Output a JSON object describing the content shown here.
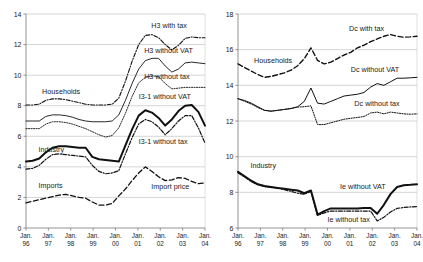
{
  "figure": {
    "panels": [
      "left-panel-households-industry",
      "right-panel-households-industry"
    ]
  },
  "chart_data": [
    {
      "type": "line",
      "id": "left",
      "title": "",
      "xlabel": "",
      "ylabel": "",
      "grid": true,
      "legend_position": "inline-annotations",
      "ylim": [
        0,
        14
      ],
      "yticks": [
        0,
        2,
        4,
        6,
        8,
        10,
        12,
        14
      ],
      "ytick_labels": [
        "0",
        "2",
        "4",
        "6",
        "8",
        "10",
        "12",
        "14"
      ],
      "x": [
        "Jan. 96",
        "Jan. 97",
        "Jan. 98",
        "Jan. 99",
        "Jan. 00",
        "Jan. 01",
        "Jan. 02",
        "Jan. 03",
        "Jan. 04"
      ],
      "xtick_labels_line1": [
        "Jan.",
        "Jan.",
        "Jan.",
        "Jan.",
        "Jan.",
        "Jan.",
        "Jan.",
        "Jan.",
        "Jan."
      ],
      "xtick_labels_line2": [
        "96",
        "97",
        "98",
        "99",
        "00",
        "01",
        "02",
        "03",
        "04"
      ],
      "group_labels": [
        {
          "text": "Households",
          "x_frac": 0.09,
          "y_value": 8.75
        },
        {
          "text": "Industry",
          "x_frac": 0.07,
          "y_value": 5.0
        },
        {
          "text": "Imports",
          "x_frac": 0.07,
          "y_value": 2.6
        }
      ],
      "annotations": [
        {
          "text": "H3 with tax",
          "x_frac": 0.7,
          "y_value": 13.1
        },
        {
          "text": "H3 without VAT",
          "x_frac": 0.66,
          "y_value": 11.45
        },
        {
          "text": "H3 without tax",
          "x_frac": 0.66,
          "y_value": 9.75
        },
        {
          "text": "I3-1 without VAT",
          "x_frac": 0.63,
          "y_value": 8.45
        },
        {
          "text": "I3-1 without tax",
          "x_frac": 0.63,
          "y_value": 5.5
        },
        {
          "text": "Import price",
          "x_frac": 0.7,
          "y_value": 2.55
        }
      ],
      "series": [
        {
          "name": "H3 with tax",
          "style": "dash-dot",
          "width": 1.1,
          "values": [
            8.05,
            8.05,
            8.1,
            8.35,
            8.45,
            8.45,
            8.4,
            8.3,
            8.2,
            8.1,
            8.05,
            8.05,
            8.05,
            8.1,
            8.5,
            9.6,
            10.9,
            12.0,
            12.6,
            12.65,
            12.45,
            12.0,
            11.65,
            11.95,
            12.4,
            12.5,
            12.45,
            12.45
          ]
        },
        {
          "name": "H3 without VAT",
          "style": "solid",
          "width": 0.9,
          "values": [
            7.0,
            7.0,
            7.0,
            7.3,
            7.4,
            7.4,
            7.35,
            7.25,
            7.1,
            7.0,
            6.95,
            6.95,
            6.95,
            7.0,
            7.4,
            8.35,
            9.45,
            10.4,
            10.95,
            11.1,
            11.1,
            10.6,
            10.2,
            10.4,
            10.8,
            10.85,
            10.8,
            10.75
          ]
        },
        {
          "name": "H3 without tax",
          "style": "dotted",
          "width": 0.9,
          "values": [
            6.5,
            6.5,
            6.5,
            6.8,
            6.95,
            6.95,
            6.9,
            6.8,
            6.65,
            6.5,
            6.3,
            6.1,
            5.95,
            6.05,
            6.55,
            7.5,
            8.6,
            9.5,
            9.85,
            9.95,
            9.9,
            9.45,
            9.1,
            9.15,
            9.2,
            9.2,
            9.2,
            9.2
          ]
        },
        {
          "name": "I3-1 without VAT",
          "style": "solid-bold",
          "width": 2.0,
          "values": [
            4.35,
            4.4,
            4.55,
            4.95,
            5.25,
            5.35,
            5.35,
            5.3,
            5.25,
            5.25,
            4.65,
            4.5,
            4.45,
            4.4,
            4.35,
            5.4,
            6.45,
            7.35,
            7.7,
            7.55,
            7.2,
            6.7,
            7.1,
            7.65,
            8.0,
            8.05,
            7.6,
            6.7
          ]
        },
        {
          "name": "I3-1 without tax",
          "style": "dash-dot",
          "width": 1.2,
          "values": [
            3.85,
            3.9,
            4.1,
            4.5,
            4.8,
            4.85,
            4.8,
            4.75,
            4.7,
            4.65,
            4.1,
            3.7,
            3.55,
            3.6,
            3.75,
            4.85,
            5.9,
            6.8,
            7.1,
            6.95,
            6.6,
            6.1,
            6.5,
            7.0,
            7.35,
            7.35,
            6.55,
            5.55
          ]
        },
        {
          "name": "Import price",
          "style": "dashed",
          "width": 1.3,
          "values": [
            1.65,
            1.75,
            1.85,
            1.95,
            2.05,
            2.15,
            2.2,
            2.1,
            2.0,
            1.95,
            1.7,
            1.5,
            1.5,
            1.6,
            2.1,
            2.55,
            3.1,
            3.6,
            4.0,
            3.7,
            3.35,
            3.1,
            3.15,
            3.3,
            3.25,
            3.05,
            2.9,
            2.95
          ]
        }
      ]
    },
    {
      "type": "line",
      "id": "right",
      "title": "",
      "xlabel": "",
      "ylabel": "",
      "grid": true,
      "legend_position": "inline-annotations",
      "ylim": [
        6,
        18
      ],
      "yticks": [
        6,
        8,
        10,
        12,
        14,
        16,
        18
      ],
      "ytick_labels": [
        "6",
        "8",
        "10",
        "12",
        "14",
        "16",
        "18"
      ],
      "x": [
        "Jan. 96",
        "Jan. 97",
        "Jan. 98",
        "Jan. 99",
        "Jan. 00",
        "Jan. 01",
        "Jan. 02",
        "Jan. 03",
        "Jan. 04"
      ],
      "xtick_labels_line1": [
        "Jan.",
        "Jan.",
        "Jan.",
        "Jan.",
        "Jan.",
        "Jan.",
        "Jan.",
        "Jan.",
        "Jan."
      ],
      "xtick_labels_line2": [
        "96",
        "97",
        "98",
        "99",
        "00",
        "01",
        "02",
        "03",
        "04"
      ],
      "group_labels": [
        {
          "text": "Households",
          "x_frac": 0.09,
          "y_value": 15.25
        },
        {
          "text": "Industry",
          "x_frac": 0.07,
          "y_value": 9.35
        }
      ],
      "annotations": [
        {
          "text": "Dc with tax",
          "x_frac": 0.62,
          "y_value": 17.05
        },
        {
          "text": "Dc without VAT",
          "x_frac": 0.63,
          "y_value": 14.75
        },
        {
          "text": "Dc without tax",
          "x_frac": 0.65,
          "y_value": 12.85
        },
        {
          "text": "Ie without VAT",
          "x_frac": 0.57,
          "y_value": 8.2
        },
        {
          "text": "Ie without tax",
          "x_frac": 0.5,
          "y_value": 6.35
        }
      ],
      "series": [
        {
          "name": "Dc with tax",
          "style": "dashed",
          "width": 1.4,
          "values": [
            15.2,
            15.0,
            14.8,
            14.6,
            14.45,
            14.5,
            14.6,
            14.7,
            14.85,
            15.1,
            15.5,
            16.1,
            15.4,
            15.2,
            15.3,
            15.5,
            15.7,
            15.85,
            16.1,
            16.25,
            16.45,
            16.6,
            16.75,
            16.85,
            16.75,
            16.7,
            16.72,
            16.75
          ]
        },
        {
          "name": "Dc without VAT",
          "style": "solid",
          "width": 1.0,
          "values": [
            13.25,
            13.15,
            13.0,
            12.8,
            12.6,
            12.55,
            12.6,
            12.65,
            12.7,
            12.8,
            13.1,
            13.85,
            13.0,
            12.95,
            13.1,
            13.25,
            13.4,
            13.45,
            13.5,
            13.6,
            13.9,
            14.1,
            14.0,
            14.2,
            14.4,
            14.4,
            14.42,
            14.45
          ]
        },
        {
          "name": "Dc without tax",
          "style": "dotted",
          "width": 1.0,
          "values": [
            13.25,
            13.1,
            12.95,
            12.75,
            12.6,
            12.55,
            12.6,
            12.65,
            12.7,
            12.78,
            12.8,
            12.85,
            11.8,
            11.8,
            11.9,
            12.0,
            12.1,
            12.15,
            12.2,
            12.25,
            12.45,
            12.5,
            12.4,
            12.5,
            12.45,
            12.4,
            12.38,
            12.4
          ]
        },
        {
          "name": "Ie without VAT",
          "style": "solid-bold",
          "width": 2.0,
          "values": [
            9.15,
            8.9,
            8.65,
            8.45,
            8.35,
            8.3,
            8.25,
            8.2,
            8.15,
            8.1,
            7.95,
            8.1,
            6.75,
            6.95,
            7.1,
            7.1,
            7.1,
            7.1,
            7.1,
            7.12,
            7.12,
            6.8,
            7.3,
            7.9,
            8.3,
            8.4,
            8.42,
            8.45
          ]
        },
        {
          "name": "Ie without tax",
          "style": "dash-dot",
          "width": 1.2,
          "values": [
            9.1,
            8.85,
            8.6,
            8.42,
            8.32,
            8.27,
            8.22,
            8.15,
            8.05,
            7.95,
            7.9,
            8.05,
            6.7,
            6.85,
            6.95,
            6.95,
            6.95,
            6.95,
            6.95,
            6.95,
            6.95,
            6.4,
            6.6,
            6.9,
            7.1,
            7.15,
            7.18,
            7.2
          ]
        }
      ]
    }
  ]
}
